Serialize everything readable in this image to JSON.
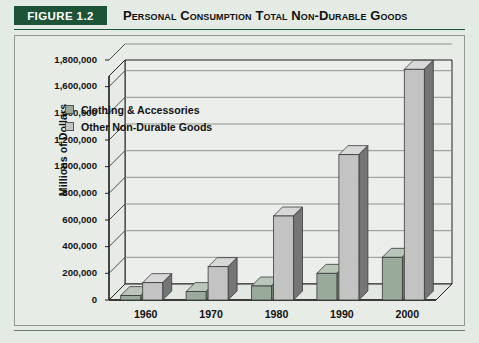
{
  "header": {
    "figure_badge": "FIGURE 1.2",
    "title": "Personal Consumption Total Non-Durable Goods"
  },
  "colors": {
    "page_background": "#e4eae4",
    "panel_background": "#e7ece7",
    "accent_green": "#1d5336",
    "badge_text": "#ffffff",
    "clothing_front": "#9aaa9a",
    "clothing_top": "#b9c6b9",
    "clothing_side": "#6f7f70",
    "other_front": "#c3c3c3",
    "other_top": "#d8d8d8",
    "other_side": "#757575",
    "axis_line": "#222222",
    "gridline": "#7f8c80"
  },
  "chart_data": {
    "type": "bar",
    "title": "Personal Consumption Total Non-Durable Goods",
    "xlabel": "",
    "ylabel": "Millions of Dollars",
    "categories": [
      "1960",
      "1970",
      "1980",
      "1990",
      "2000"
    ],
    "series": [
      {
        "name": "Clothing & Accessories",
        "values": [
          33000,
          63000,
          105000,
          200000,
          320000
        ]
      },
      {
        "name": "Other Non-Durable Goods",
        "values": [
          130000,
          250000,
          630000,
          1090000,
          1730000
        ]
      }
    ],
    "ylim": [
      0,
      1800000
    ],
    "ytick_step": 200000,
    "ytick_labels": [
      "0",
      "200,000",
      "400,000",
      "600,000",
      "800,000",
      "1,000,000",
      "1,200,000",
      "1,400,000",
      "1,600,000",
      "1,800,000"
    ],
    "grid": true,
    "legend_position": "upper-left-inside",
    "three_d": true
  }
}
